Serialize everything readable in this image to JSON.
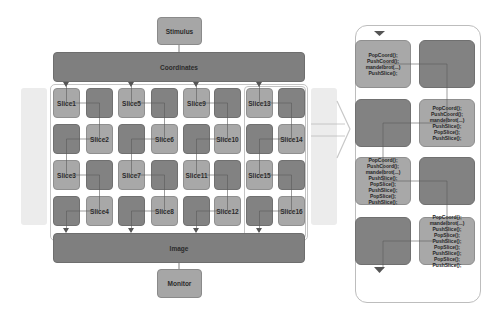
{
  "diagram": {
    "stimulus": "Stimulus",
    "coordinates": "Coordinates",
    "image": "Image",
    "monitor": "Monitor",
    "slices": [
      "Slice1",
      "Slice2",
      "Slice3",
      "Slice4",
      "Slice5",
      "Slice6",
      "Slice7",
      "Slice8",
      "Slice9",
      "Slice10",
      "Slice11",
      "Slice12",
      "Slice13",
      "Slice14",
      "Slice15",
      "Slice16"
    ],
    "detail_panel": {
      "tiles": [
        {
          "code": "PopCoord();\nPushCoord();\nmandelbrot(...)\nPushSlice();"
        },
        {
          "code": ""
        },
        {
          "code": ""
        },
        {
          "code": "PopCoord();\nPushCoord();\nmandelbrot(...)\nPushSlice();\nPopSlice();\nPushSlice();"
        },
        {
          "code": "PopCoord();\nPushCoord();\nmandelbrot(...)\nPushSlice();\nPopSlice();\nPushSlice();\nPopSlice();\nPushSlice();"
        },
        {
          "code": ""
        },
        {
          "code": ""
        },
        {
          "code": "PopCoord();\nmandelbrot(...)\nPushSlice();\nPopSlice();\nPushSlice();\nPopSlice();\nPushSlice();\nPopSlice();\nPushSlice();"
        }
      ]
    },
    "colors": {
      "light_box": "#a6a6a6",
      "dark_box": "#7f7f7f",
      "line": "#5a5a5a",
      "ghost": "#ececec",
      "container_border": "#c4c4c4"
    }
  }
}
